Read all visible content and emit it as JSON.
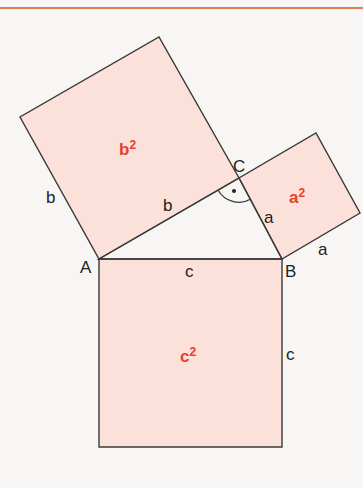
{
  "diagram": {
    "colors": {
      "accent_rule": "#e5794f",
      "square_fill": "#fbe1d9",
      "area_label": "#e8402a",
      "stroke": "#3a3a3a"
    },
    "vertices": {
      "A": "A",
      "B": "B",
      "C": "C"
    },
    "side_labels": {
      "a": "a",
      "b": "b",
      "c": "c"
    },
    "areas": {
      "a_square": {
        "base": "a",
        "exp": "2"
      },
      "b_square": {
        "base": "b",
        "exp": "2"
      },
      "c_square": {
        "base": "c",
        "exp": "2"
      }
    },
    "right_angle_marker": "·"
  }
}
